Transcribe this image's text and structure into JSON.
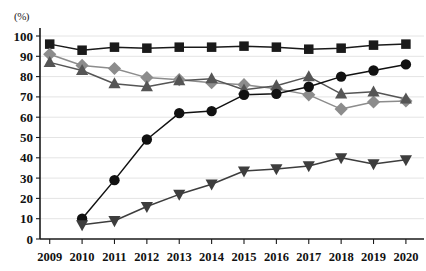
{
  "axis_unit_label": "(%)",
  "chart_data": {
    "type": "line",
    "title": "",
    "subtitle": "",
    "xlabel": "",
    "ylabel": "",
    "unit_label": "(%)",
    "categories": [
      "2009",
      "2010",
      "2011",
      "2012",
      "2013",
      "2014",
      "2015",
      "2016",
      "2017",
      "2018",
      "2019",
      "2020"
    ],
    "x": [
      2009,
      2010,
      2011,
      2012,
      2013,
      2014,
      2015,
      2016,
      2017,
      2018,
      2019,
      2020
    ],
    "ylim": [
      0,
      100
    ],
    "ytick_labels": [
      "0",
      "10",
      "20",
      "30",
      "40",
      "50",
      "60",
      "70",
      "80",
      "90",
      "100"
    ],
    "ytick_values": [
      0,
      10,
      20,
      30,
      40,
      50,
      60,
      70,
      80,
      90,
      100
    ],
    "grid": true,
    "grid_axis": "y",
    "legend": false,
    "legend_position": "none",
    "series": [
      {
        "name": "series-square",
        "marker": "square",
        "color": "#1a1a1a",
        "line_color": "#1a1a1a",
        "values": [
          96,
          93,
          94.5,
          94,
          94.5,
          94.5,
          95,
          94.5,
          93.5,
          94,
          95.5,
          96
        ]
      },
      {
        "name": "series-diamond",
        "marker": "diamond",
        "color": "#8c8c8c",
        "line_color": "#8c8c8c",
        "values": [
          91,
          85.5,
          84,
          79.5,
          78.5,
          77,
          76,
          74,
          71,
          64,
          67.5,
          68
        ]
      },
      {
        "name": "series-triangle-up",
        "marker": "triangle-up",
        "color": "#555555",
        "line_color": "#555555",
        "values": [
          87,
          83,
          76.5,
          75,
          78,
          79,
          73.5,
          75.5,
          80,
          71.5,
          72.5,
          69
        ]
      },
      {
        "name": "series-circle",
        "marker": "circle",
        "color": "#111111",
        "line_color": "#111111",
        "values": [
          null,
          10,
          29,
          49,
          62,
          63,
          71,
          71.5,
          75,
          80,
          83,
          86
        ]
      },
      {
        "name": "series-triangle-down",
        "marker": "triangle-down",
        "color": "#3d3d3d",
        "line_color": "#3d3d3d",
        "values": [
          null,
          7,
          9,
          16,
          22,
          27,
          33.5,
          34.5,
          36,
          40,
          37,
          39
        ]
      }
    ]
  }
}
